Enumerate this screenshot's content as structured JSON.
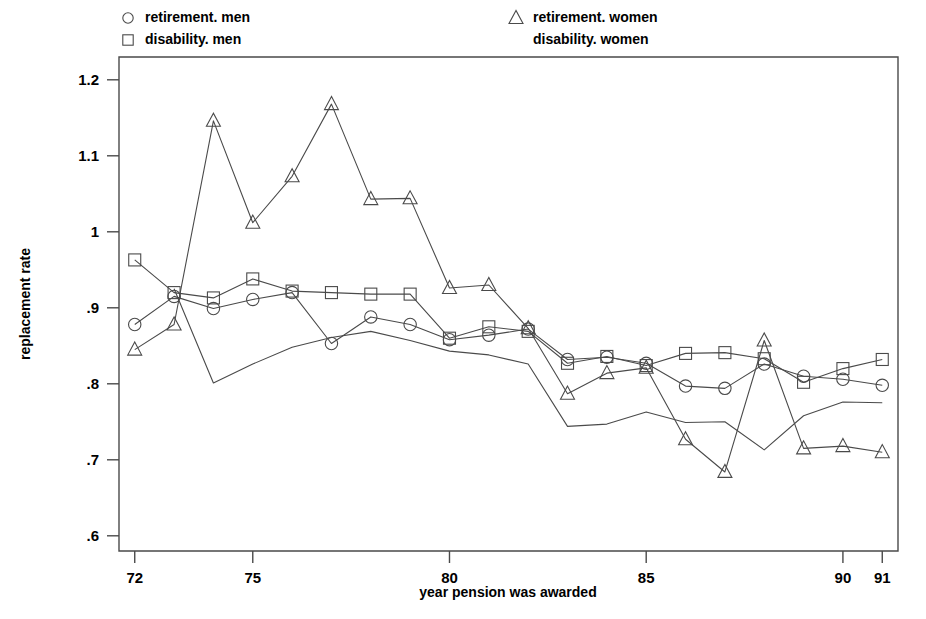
{
  "chart_data": {
    "type": "line",
    "title": "",
    "xlabel": "year pension was awarded",
    "ylabel": "replacement rate",
    "xlim": [
      71.6,
      91.4
    ],
    "ylim": [
      0.58,
      1.23
    ],
    "xticks": [
      72,
      75,
      80,
      85,
      90,
      91
    ],
    "xticklabels": [
      "72",
      "75",
      "80",
      "85",
      "90",
      "91"
    ],
    "yticks": [
      0.6,
      0.7,
      0.8,
      0.9,
      1.0,
      1.1,
      1.2
    ],
    "yticklabels": [
      ".6",
      ".7",
      ".8",
      ".9",
      "1",
      "1.1",
      "1.2"
    ],
    "grid": false,
    "legend_position": "above-plot",
    "x": [
      72,
      73,
      74,
      75,
      76,
      77,
      78,
      79,
      80,
      81,
      82,
      83,
      84,
      85,
      86,
      87,
      88,
      89,
      90,
      91
    ],
    "series": [
      {
        "name": "retirement. men",
        "marker": "circle",
        "x": [
          72,
          73,
          74,
          75,
          76,
          77,
          78,
          79,
          80,
          81,
          82,
          83,
          84,
          85,
          86,
          87,
          88,
          89,
          90,
          91
        ],
        "values": [
          0.878,
          0.915,
          0.899,
          0.911,
          0.92,
          0.853,
          0.888,
          0.878,
          0.858,
          0.864,
          0.872,
          0.832,
          0.835,
          0.827,
          0.797,
          0.794,
          0.826,
          0.81,
          0.806,
          0.798
        ]
      },
      {
        "name": "disability. men",
        "marker": "square",
        "x": [
          72,
          73,
          74,
          75,
          76,
          77,
          78,
          79,
          80,
          81,
          82,
          83,
          84,
          85,
          86,
          87,
          88,
          89,
          90,
          91
        ],
        "values": [
          0.963,
          0.92,
          0.913,
          0.938,
          0.922,
          0.92,
          0.918,
          0.918,
          0.86,
          0.875,
          0.869,
          0.827,
          0.836,
          0.824,
          0.84,
          0.841,
          0.833,
          0.802,
          0.82,
          0.832
        ]
      },
      {
        "name": "retirement. women",
        "marker": "triangle",
        "x": [
          72,
          73,
          74,
          75,
          76,
          77,
          78,
          79,
          80,
          81,
          82,
          83,
          84,
          85,
          86,
          87,
          88,
          89,
          90,
          91
        ],
        "values": [
          0.845,
          0.878,
          1.146,
          1.012,
          1.073,
          1.168,
          1.043,
          1.044,
          0.926,
          0.93,
          0.873,
          0.787,
          0.814,
          0.821,
          0.727,
          0.684,
          0.857,
          0.715,
          0.718,
          0.71
        ]
      },
      {
        "name": "disability. women",
        "marker": "none",
        "x": [
          73,
          74,
          75,
          76,
          77,
          78,
          79,
          80,
          81,
          82,
          83,
          84,
          85,
          86,
          87,
          88,
          89,
          90,
          91
        ],
        "values": [
          0.925,
          0.801,
          0.826,
          0.848,
          0.861,
          0.869,
          0.857,
          0.843,
          0.838,
          0.826,
          0.744,
          0.747,
          0.763,
          0.749,
          0.75,
          0.713,
          0.758,
          0.776,
          0.775
        ]
      }
    ]
  },
  "legend": {
    "entries": [
      {
        "label": "retirement. men",
        "marker": "circle"
      },
      {
        "label": "disability. men",
        "marker": "square"
      },
      {
        "label": "retirement. women",
        "marker": "triangle"
      },
      {
        "label": "disability. women",
        "marker": "none"
      }
    ]
  },
  "axes": {
    "y_title": "replacement rate",
    "x_title": "year pension was awarded"
  },
  "colors": {
    "line": "#4a4a4a",
    "text": "#000000",
    "background": "#ffffff"
  }
}
